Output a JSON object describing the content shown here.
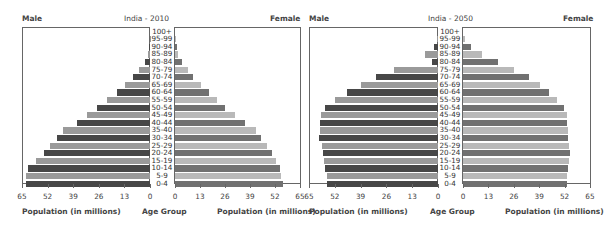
{
  "chart_data": [
    {
      "type": "bar",
      "subtype": "population-pyramid",
      "title": "India - 2010",
      "left_label": "Male",
      "right_label": "Female",
      "xlabel_left": "Population (in millions)",
      "xlabel_center": "Age Group",
      "xlabel_right": "Population (in millions)",
      "xticks": [
        0,
        13,
        26,
        39,
        52,
        65
      ],
      "xlim": [
        0,
        65
      ],
      "grid": false,
      "categories": [
        "100+",
        "95-99",
        "90-94",
        "85-89",
        "80-84",
        "75-79",
        "70-74",
        "65-69",
        "60-64",
        "55-59",
        "50-54",
        "45-49",
        "40-44",
        "35-40",
        "30-34",
        "25-29",
        "20-24",
        "15-19",
        "10-14",
        "5-9",
        "0-4"
      ],
      "series": [
        {
          "name": "Male",
          "values": [
            0,
            0.1,
            0.5,
            1,
            2.6,
            5.6,
            8.7,
            12.8,
            17,
            22,
            27,
            32,
            37,
            44,
            47,
            51,
            54,
            58,
            62,
            63,
            63
          ]
        },
        {
          "name": "Female",
          "values": [
            0,
            0.2,
            1,
            1.5,
            3.8,
            6.6,
            9.5,
            13.7,
            17.5,
            21.8,
            26,
            31,
            36.5,
            42,
            44.6,
            47.8,
            50.3,
            52.3,
            54.6,
            55,
            56
          ]
        }
      ]
    },
    {
      "type": "bar",
      "subtype": "population-pyramid",
      "title": "India - 2050",
      "left_label": "Male",
      "right_label": "Female",
      "xlabel_left": "Population (in millions)",
      "xlabel_center": "Age Group",
      "xlabel_right": "Population (in millions)",
      "xticks": [
        0,
        13,
        26,
        39,
        52,
        65
      ],
      "xlim": [
        0,
        65
      ],
      "grid": false,
      "categories": [
        "100+",
        "95-99",
        "90-94",
        "85-89",
        "80-84",
        "75-79",
        "70-74",
        "65-69",
        "60-64",
        "55-59",
        "50-54",
        "45-49",
        "40-44",
        "35-40",
        "30-34",
        "25-29",
        "20-24",
        "15-19",
        "10-14",
        "5-9",
        "0-4"
      ],
      "series": [
        {
          "name": "Male",
          "values": [
            0,
            0.5,
            2,
            6.6,
            3,
            22,
            31,
            39,
            45.7,
            52,
            57,
            59,
            59.5,
            59.5,
            60,
            58.7,
            58,
            57.5,
            57,
            56,
            56
          ]
        },
        {
          "name": "Female",
          "values": [
            0,
            1,
            4,
            9.5,
            18,
            26,
            34,
            39.5,
            44,
            48,
            51.5,
            53,
            53,
            53.5,
            53.5,
            54.5,
            54.7,
            54,
            53.7,
            53,
            53
          ]
        }
      ]
    }
  ],
  "colors": {
    "male_dark": "#474747",
    "male_light": "#9a9a9a",
    "female_dark": "#717171",
    "female_light": "#b9b9b9"
  },
  "charts": [
    {
      "title": "India - 2010",
      "male": "Male",
      "female": "Female",
      "x_title": "Population (in millions)",
      "age_title": "Age Group"
    },
    {
      "title": "India - 2050",
      "male": "Male",
      "female": "Female",
      "x_title": "Population (in millions)",
      "age_title": "Age Group"
    }
  ]
}
